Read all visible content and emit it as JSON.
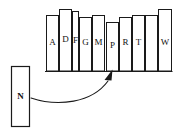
{
  "diagram": {
    "baseline": {
      "x1": 45,
      "x2": 173,
      "y": 71
    },
    "bars": [
      {
        "label": "A",
        "x": 46,
        "width": 13,
        "top": 15,
        "label_y": 45
      },
      {
        "label": "D",
        "x": 59,
        "width": 13,
        "top": 9,
        "label_y": 42
      },
      {
        "label": "F",
        "x": 72,
        "width": 7,
        "top": 11,
        "label_y": 43
      },
      {
        "label": "G",
        "x": 79,
        "width": 13,
        "top": 17,
        "label_y": 45
      },
      {
        "label": "M",
        "x": 92,
        "width": 13,
        "top": 15,
        "label_y": 45
      },
      {
        "label": "P",
        "x": 106,
        "width": 13,
        "top": 22,
        "label_y": 48
      },
      {
        "label": "R",
        "x": 119,
        "width": 13,
        "top": 17,
        "label_y": 45
      },
      {
        "label": "T",
        "x": 132,
        "width": 13,
        "top": 15,
        "label_y": 45
      },
      {
        "label": "W",
        "x": 158,
        "width": 14,
        "top": 9,
        "label_y": 45
      }
    ],
    "extra_bar": {
      "label": "",
      "x": 145,
      "width": 13,
      "top": 15
    },
    "insert_box": {
      "label": "N",
      "x": 11,
      "y": 66,
      "width": 18,
      "height": 60,
      "label_x": 20,
      "label_y": 99
    },
    "arrow": {
      "name": "insertion-arrow",
      "path": "M 31 98 C 60 106, 92 102, 108 82",
      "head_points": "112,70 105,80 111,80",
      "tip_x": 112,
      "tip_y": 70
    },
    "colors": {
      "stroke": "#1a1a1a",
      "fill": "#ffffff",
      "text": "#111111"
    }
  }
}
